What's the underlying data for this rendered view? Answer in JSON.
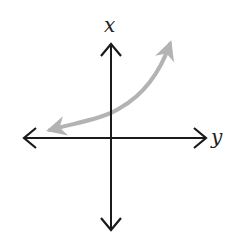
{
  "diagram": {
    "type": "coordinate-axes-with-curve",
    "vertical_axis_label": "x",
    "horizontal_axis_label": "y",
    "axis_color": "#1a1a1a",
    "curve_color": "#b3b3b3",
    "curve_description": "increasing exponential-style curve with arrows at both ends, approaching the horizontal axis on the left and rising steeply on the right; crosses the vertical axis above the origin"
  }
}
